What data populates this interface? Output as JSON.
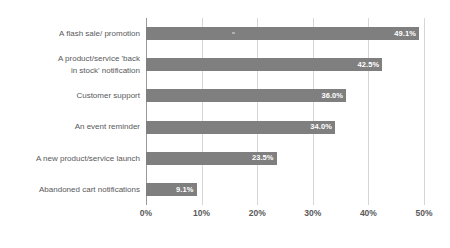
{
  "chart_data": {
    "type": "bar",
    "orientation": "horizontal",
    "title": "",
    "subtitle": "",
    "xlabel": "",
    "ylabel": "",
    "categories": [
      "A flash sale/ promotion",
      "A product/service 'back\nin stock' notification",
      "Customer support",
      "An event reminder",
      "A new product/service launch",
      "Abandoned cart notifications"
    ],
    "values": [
      49.1,
      42.5,
      36.0,
      34.0,
      23.5,
      9.1
    ],
    "value_labels": [
      "49.1%",
      "42.5%",
      "36.0%",
      "34.0%",
      "23.5%",
      "9.1%"
    ],
    "xlim": [
      0,
      50
    ],
    "xticks": [
      0,
      10,
      20,
      30,
      40,
      50
    ],
    "xtick_labels": [
      "0%",
      "10%",
      "20%",
      "30%",
      "40%",
      "50%"
    ],
    "grid": true,
    "grid_axis": "x",
    "legend": false,
    "legend_position": "none",
    "series": [
      {
        "name": "",
        "values": [
          49.1,
          42.5,
          36.0,
          34.0,
          23.5,
          9.1
        ]
      }
    ]
  },
  "style": {
    "bar_color": "#7f7f7f",
    "value_label_color": "#ffffff",
    "category_label_color": "#58595b",
    "tick_label_color": "#58595b",
    "gridline_color": "#d6d6d6",
    "axis_color": "#9a9a9a",
    "background": "#ffffff"
  }
}
